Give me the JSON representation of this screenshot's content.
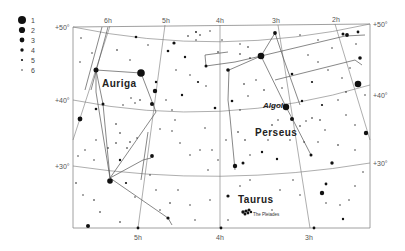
{
  "map": {
    "type": "star-chart",
    "legend": {
      "title": "",
      "magnitudes": [
        "1",
        "2",
        "3",
        "4",
        "5",
        "6"
      ]
    },
    "ra_labels_top": [
      "6h",
      "5h",
      "4h",
      "3h",
      "2h"
    ],
    "ra_labels_bottom": [
      "5h",
      "4h",
      "3h"
    ],
    "dec_labels_left": [
      "+50°",
      "+40°",
      "+30°"
    ],
    "dec_labels_right": [
      "+50°",
      "+40°",
      "+30°"
    ],
    "constellations": [
      "Auriga",
      "Perseus",
      "Taurus"
    ],
    "named_stars": [
      "Algol"
    ],
    "clusters": [
      "The Pleiades"
    ],
    "colors": {
      "background": "#ffffff",
      "frame": "#888888",
      "grid": "#777777",
      "lines": "#555555",
      "stars": "#111111",
      "text": "#222222"
    }
  }
}
